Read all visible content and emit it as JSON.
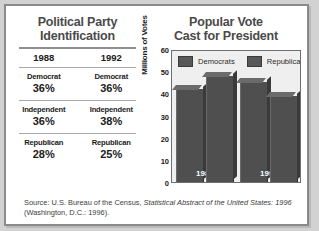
{
  "table": {
    "title_line1": "Political Party",
    "title_line2": "Identification",
    "year_headers": [
      "1988",
      "1992"
    ],
    "groups": [
      {
        "party": [
          "Democrat",
          "Democrat"
        ],
        "values": [
          "36%",
          "36%"
        ]
      },
      {
        "party": [
          "Independent",
          "Independent"
        ],
        "values": [
          "36%",
          "38%"
        ]
      },
      {
        "party": [
          "Republican",
          "Republican"
        ],
        "values": [
          "28%",
          "25%"
        ]
      }
    ]
  },
  "chart": {
    "title_line1": "Popular Vote",
    "title_line2": "Cast for President"
  },
  "source": {
    "prefix": "Source: U.S. Bureau of the Census, ",
    "italic": "Statistical Abstract of the United States:",
    "italic2": "1996",
    "suffix": " (Washington, D.C.: 1996)."
  },
  "chart_data": {
    "type": "bar",
    "title": "Popular Vote Cast for President",
    "xlabel": "",
    "ylabel": "Millions of Votes",
    "categories": [
      "1988",
      "1992"
    ],
    "series": [
      {
        "name": "Democrats",
        "values": [
          42,
          45
        ],
        "color": "#4f4f4f"
      },
      {
        "name": "Republicans",
        "values": [
          48,
          39
        ],
        "color": "#4f4f4f"
      }
    ],
    "ylim": [
      0,
      60
    ],
    "yticks": [
      60,
      50,
      40,
      30,
      20,
      10,
      0
    ],
    "grid": false,
    "legend": [
      "Democrats",
      "Republicans"
    ],
    "legend_position": "top-left"
  }
}
